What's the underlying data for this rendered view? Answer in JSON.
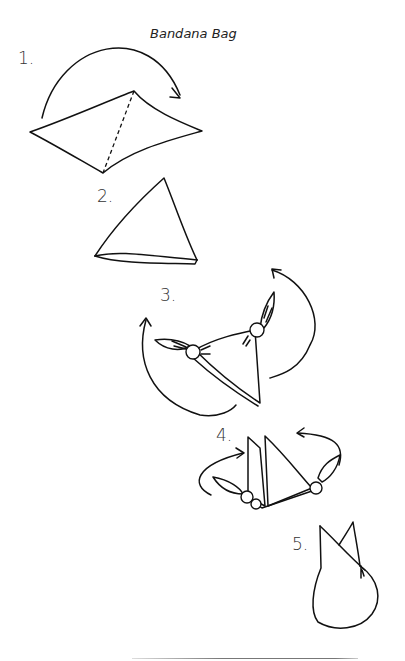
{
  "title": "Bandana Bag",
  "steps": [
    {
      "number": "1.",
      "description": "Square bandana with diagonal fold line and arrow folding one corner over"
    },
    {
      "number": "2.",
      "description": "Bandana folded into a triangle"
    },
    {
      "number": "3.",
      "description": "Side corners tied into knots, arrows showing flip"
    },
    {
      "number": "4.",
      "description": "Triangle folded with knotted corners, arrows showing wrap"
    },
    {
      "number": "5.",
      "description": "Finished bag with two pointed top corners"
    }
  ]
}
